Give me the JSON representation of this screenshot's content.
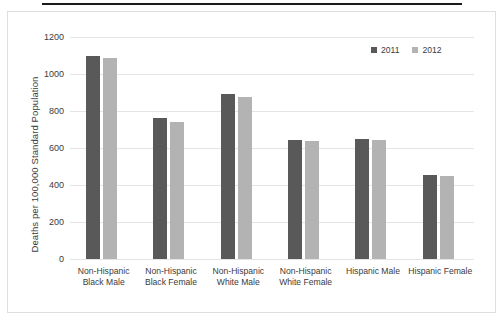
{
  "chart_data": {
    "type": "bar",
    "title": "",
    "subtitle": "",
    "xlabel": "",
    "ylabel": "Deaths per 100,000 Standard Population",
    "ylim": [
      0,
      1200
    ],
    "ytick_values": [
      0,
      200,
      400,
      600,
      800,
      1000,
      1200
    ],
    "ytick_labels": [
      "0",
      "200",
      "400",
      "600",
      "800",
      "1000",
      "1200"
    ],
    "grid": true,
    "legend_position": "top-right",
    "categories": [
      "Non-Hispanic Black Male",
      "Non-Hispanic Black Female",
      "Non-Hispanic White Male",
      "Non-Hispanic White Female",
      "Hispanic Male",
      "Hispanic Female"
    ],
    "category_lines": [
      [
        "Non-Hispanic",
        "Black Male"
      ],
      [
        "Non-Hispanic",
        "Black Female"
      ],
      [
        "Non-Hispanic",
        "White Male"
      ],
      [
        "Non-Hispanic",
        "White Female"
      ],
      [
        "Hispanic Male",
        ""
      ],
      [
        "Hispanic Female",
        ""
      ]
    ],
    "series": [
      {
        "name": "2011",
        "color": "#595959",
        "values": [
          1100,
          760,
          890,
          645,
          648,
          455
        ]
      },
      {
        "name": "2012",
        "color": "#b3b3b3",
        "values": [
          1085,
          742,
          875,
          638,
          642,
          450
        ]
      }
    ]
  },
  "legend": {
    "items": [
      {
        "label": "2011",
        "color": "#595959"
      },
      {
        "label": "2012",
        "color": "#b3b3b3"
      }
    ]
  },
  "decor": {
    "rule_color": "#1a1a1a",
    "panel_border_color": "#dededd",
    "gridline_color": "#e4e4e3",
    "text_color": "#3b3b3b"
  }
}
